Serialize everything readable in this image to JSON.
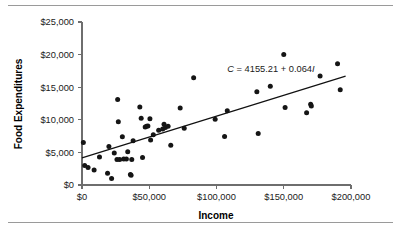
{
  "figure": {
    "has_top_rule": true,
    "has_bottom_rule": true,
    "background_color": "#ffffff",
    "point_color": "#151515",
    "line_color": "#111111",
    "axis_color": "#6e6e6e"
  },
  "chart_data": {
    "type": "scatter",
    "title": "",
    "xlabel": "Income",
    "ylabel": "Food Expenditures",
    "xlim": [
      0,
      200000
    ],
    "ylim": [
      0,
      25000
    ],
    "grid": false,
    "legend": null,
    "xticks": [
      0,
      50000,
      100000,
      150000,
      200000
    ],
    "xtick_labels": [
      "$0",
      "$50,000",
      "$100,000",
      "$150,000",
      "$200,000"
    ],
    "yticks": [
      0,
      5000,
      10000,
      15000,
      20000,
      25000
    ],
    "ytick_labels": [
      "$0",
      "$5,000",
      "$10,000",
      "$15,000",
      "$20,000",
      "$25,000"
    ],
    "annotation": {
      "text": "C = 4155.21 + 0.064I",
      "parts": [
        "C",
        " = 4155.21 + 0.064",
        "I"
      ],
      "x": 108000,
      "y": 17300
    },
    "trendline": {
      "intercept": 4155.21,
      "slope": 0.064,
      "x_start": 0,
      "x_end": 196000,
      "y_start": 4155,
      "y_end": 16699
    },
    "points": [
      [
        1000,
        6500
      ],
      [
        2000,
        3000
      ],
      [
        4500,
        2700
      ],
      [
        9000,
        2300
      ],
      [
        13000,
        4300
      ],
      [
        19000,
        1800
      ],
      [
        20000,
        5900
      ],
      [
        22000,
        1000
      ],
      [
        24000,
        4900
      ],
      [
        26000,
        3900
      ],
      [
        26500,
        13100
      ],
      [
        27000,
        9700
      ],
      [
        28000,
        3900
      ],
      [
        30000,
        7400
      ],
      [
        31000,
        4000
      ],
      [
        33000,
        4000
      ],
      [
        34000,
        5100
      ],
      [
        36000,
        1600
      ],
      [
        36500,
        1500
      ],
      [
        37000,
        3900
      ],
      [
        38000,
        6800
      ],
      [
        43000,
        11950
      ],
      [
        44000,
        10250
      ],
      [
        45000,
        4200
      ],
      [
        47000,
        8900
      ],
      [
        48000,
        9000
      ],
      [
        49000,
        9050
      ],
      [
        50500,
        10150
      ],
      [
        51000,
        6900
      ],
      [
        53000,
        7700
      ],
      [
        57000,
        8400
      ],
      [
        60000,
        8600
      ],
      [
        61000,
        9300
      ],
      [
        62000,
        8800
      ],
      [
        64000,
        9000
      ],
      [
        66000,
        6100
      ],
      [
        73000,
        11800
      ],
      [
        76000,
        8700
      ],
      [
        83000,
        16450
      ],
      [
        99000,
        10100
      ],
      [
        106000,
        7450
      ],
      [
        108000,
        11400
      ],
      [
        130000,
        14300
      ],
      [
        131000,
        7900
      ],
      [
        140000,
        15150
      ],
      [
        150000,
        20000
      ],
      [
        151000,
        11900
      ],
      [
        167000,
        11100
      ],
      [
        170000,
        12400
      ],
      [
        170500,
        12100
      ],
      [
        177000,
        16700
      ],
      [
        190000,
        18600
      ],
      [
        192000,
        14600
      ]
    ]
  }
}
